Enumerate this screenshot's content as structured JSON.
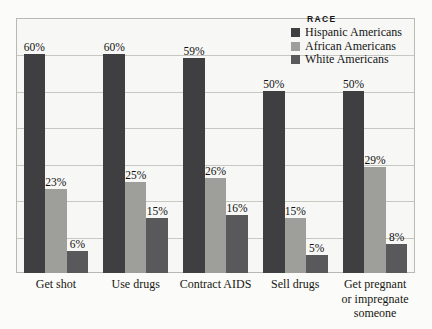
{
  "chart_data": {
    "type": "bar",
    "title": "",
    "xlabel": "",
    "ylabel": "",
    "ylim": [
      0,
      70
    ],
    "grid": true,
    "grid_interval": 10,
    "legend_position": "top-right",
    "legend_title": "RACE",
    "categories": [
      "Get shot",
      "Use drugs",
      "Contract AIDS",
      "Sell drugs",
      "Get pregnant or impregnate someone"
    ],
    "series": [
      {
        "name": "Hispanic Americans",
        "color": "#3f3f41",
        "values": [
          60,
          60,
          59,
          50,
          50
        ],
        "labels": [
          "60%",
          "60%",
          "59%",
          "50%",
          "50%"
        ]
      },
      {
        "name": "African Americans",
        "color": "#9e9e9b",
        "values": [
          23,
          25,
          26,
          15,
          29
        ],
        "labels": [
          "23%",
          "25%",
          "26%",
          "15%",
          "29%"
        ]
      },
      {
        "name": "White Americans",
        "color": "#59595b",
        "values": [
          6,
          15,
          16,
          5,
          8
        ],
        "labels": [
          "6%",
          "15%",
          "16%",
          "5%",
          "8%"
        ]
      }
    ]
  },
  "legend": {
    "title": "RACE",
    "items": [
      {
        "label": "Hispanic Americans",
        "color": "#3f3f41"
      },
      {
        "label": "African Americans",
        "color": "#9e9e9b"
      },
      {
        "label": "White Americans",
        "color": "#59595b"
      }
    ]
  },
  "categories": [
    {
      "line1": "Get shot",
      "line2": "",
      "line3": ""
    },
    {
      "line1": "Use drugs",
      "line2": "",
      "line3": ""
    },
    {
      "line1": "Contract AIDS",
      "line2": "",
      "line3": ""
    },
    {
      "line1": "Sell drugs",
      "line2": "",
      "line3": ""
    },
    {
      "line1": "Get pregnant",
      "line2": "or impregnate",
      "line3": "someone"
    }
  ]
}
